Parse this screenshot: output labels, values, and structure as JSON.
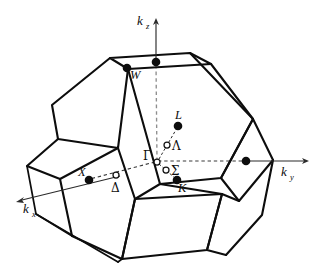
{
  "figure": {
    "background_color": "#ffffff",
    "line_color": "#0d0d0d",
    "axis_color": "#2b2b2b"
  },
  "axes": [
    {
      "name": "kz",
      "label": "k",
      "subscript": "z",
      "direction": "up",
      "style": "solid-with-arrow"
    },
    {
      "name": "ky",
      "label": "k",
      "subscript": "y",
      "direction": "right",
      "style": "solid-with-arrow"
    },
    {
      "name": "kx",
      "label": "k",
      "subscript": "x",
      "direction": "lower-left",
      "style": "solid-with-arrow"
    }
  ],
  "symmetry_points": [
    {
      "name": "gamma",
      "label": "Γ",
      "marker": "open",
      "kind": "zone-centre"
    },
    {
      "name": "x-left",
      "label": "X",
      "marker": "filled",
      "kind": "square-face-centre"
    },
    {
      "name": "x-right",
      "label": "",
      "marker": "filled",
      "kind": "square-face-centre"
    },
    {
      "name": "x-top",
      "label": "",
      "marker": "filled",
      "kind": "square-face-centre"
    },
    {
      "name": "l",
      "label": "L",
      "marker": "filled",
      "kind": "hex-face-centre"
    },
    {
      "name": "k",
      "label": "K",
      "marker": "filled",
      "kind": "edge-point"
    },
    {
      "name": "w",
      "label": "W",
      "marker": "filled",
      "kind": "vertex"
    },
    {
      "name": "lambda",
      "label": "Λ",
      "marker": "open",
      "kind": "line-gamma-to-L"
    },
    {
      "name": "delta",
      "label": "Δ",
      "marker": "open",
      "kind": "line-gamma-to-X"
    },
    {
      "name": "sigma",
      "label": "Σ",
      "marker": "open",
      "kind": "line-gamma-to-K"
    }
  ],
  "labels": {
    "kz": "k",
    "kz_sub": "z",
    "ky": "k",
    "ky_sub": "y",
    "kx": "k",
    "kx_sub": "x",
    "gamma": "Γ",
    "lambda": "Λ",
    "delta": "Δ",
    "sigma": "Σ",
    "L": "L",
    "K": "K",
    "W": "W",
    "X": "X"
  }
}
